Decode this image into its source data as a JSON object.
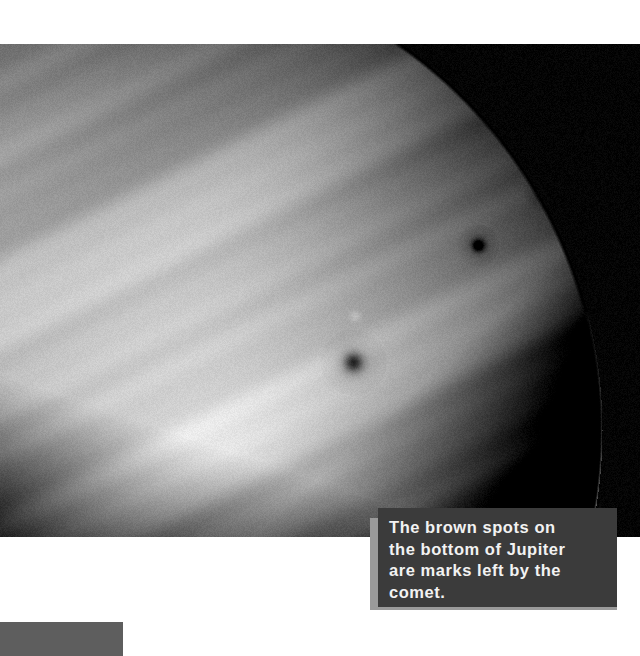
{
  "page": {
    "background_color": "#ffffff",
    "width": 640,
    "height": 656
  },
  "photo": {
    "name": "jupiter-photograph",
    "subject": "Jupiter",
    "description": "Grayscale telescope photograph of Jupiter showing banded cloud layers and dark comet impact scars near the lower right limb.",
    "space_color": "#000000",
    "planet_highlight_color": "#e8e8e8",
    "planet_shadow_color": "#1a1a1a",
    "impact_spots": [
      {
        "label": "impact-spot-upper-right",
        "x": 573,
        "y": 148,
        "radius": 7
      },
      {
        "label": "impact-spot-mid-right",
        "x": 544,
        "y": 190,
        "radius": 7
      },
      {
        "label": "impact-spot-center-right",
        "x": 478,
        "y": 245,
        "radius": 7
      },
      {
        "label": "impact-spot-lower-center",
        "x": 353,
        "y": 362,
        "radius": 11
      },
      {
        "label": "bright-oval-spot",
        "x": 355,
        "y": 316,
        "radius": 8
      }
    ]
  },
  "caption": {
    "text": "The brown spots on\nthe bottom of Jupiter\nare marks left by the\ncomet.",
    "background_color": "#3b3b3b",
    "shadow_color": "#9a9a9a",
    "text_color": "#f2f2f2"
  },
  "bottom_block": {
    "color": "#5e5e5e",
    "label": "bottom-left-gray-bar"
  }
}
